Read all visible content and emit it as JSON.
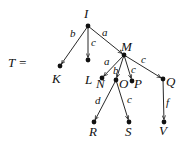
{
  "diagram": {
    "title_label": "T =",
    "color": "#111111",
    "nodes": [
      {
        "id": "I",
        "label": "I",
        "x": 88,
        "y": 26,
        "lx": 84,
        "ly": 18
      },
      {
        "id": "K",
        "label": "K",
        "x": 60,
        "y": 66,
        "lx": 52,
        "ly": 83
      },
      {
        "id": "L",
        "label": "L",
        "x": 88,
        "y": 60,
        "lx": 85,
        "ly": 84
      },
      {
        "id": "M",
        "label": "M",
        "x": 124,
        "y": 55,
        "lx": 121,
        "ly": 51
      },
      {
        "id": "N",
        "label": "N",
        "x": 102,
        "y": 78,
        "lx": 96,
        "ly": 88
      },
      {
        "id": "O",
        "label": "O",
        "x": 116,
        "y": 80,
        "lx": 119,
        "ly": 88
      },
      {
        "id": "P",
        "label": "P",
        "x": 132,
        "y": 81,
        "lx": 134,
        "ly": 88
      },
      {
        "id": "Q",
        "label": "Q",
        "x": 163,
        "y": 79,
        "lx": 166,
        "ly": 86
      },
      {
        "id": "R",
        "label": "R",
        "x": 94,
        "y": 122,
        "lx": 89,
        "ly": 136
      },
      {
        "id": "S",
        "label": "S",
        "x": 129,
        "y": 122,
        "lx": 125,
        "ly": 136
      },
      {
        "id": "V",
        "label": "V",
        "x": 164,
        "y": 122,
        "lx": 159,
        "ly": 135
      }
    ],
    "edges": [
      {
        "from": "I",
        "to": "K",
        "label": "b",
        "lx": 70,
        "ly": 37
      },
      {
        "from": "I",
        "to": "L",
        "label": "c",
        "lx": 91,
        "ly": 46
      },
      {
        "from": "I",
        "to": "M",
        "label": "a",
        "lx": 102,
        "ly": 36
      },
      {
        "from": "M",
        "to": "N",
        "label": "a",
        "lx": 104,
        "ly": 65
      },
      {
        "from": "M",
        "to": "O",
        "label": "b",
        "lx": 113,
        "ly": 74
      },
      {
        "from": "M",
        "to": "P",
        "label": "c",
        "lx": 131,
        "ly": 73
      },
      {
        "from": "M",
        "to": "Q",
        "label": "c",
        "lx": 141,
        "ly": 63
      },
      {
        "from": "O",
        "to": "R",
        "label": "d",
        "lx": 95,
        "ly": 104
      },
      {
        "from": "O",
        "to": "S",
        "label": "c",
        "lx": 127,
        "ly": 103
      },
      {
        "from": "Q",
        "to": "V",
        "label": "f",
        "lx": 166,
        "ly": 106
      }
    ]
  }
}
